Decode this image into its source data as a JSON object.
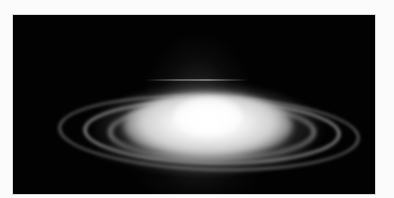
{
  "image": {
    "subject": "glowing elliptical disk with concentric rings on black background",
    "colors": {
      "page_background": "#fbfbfb",
      "frame_background": "#020202",
      "core": "#ffffff",
      "rings": "#b4b4b4"
    }
  }
}
